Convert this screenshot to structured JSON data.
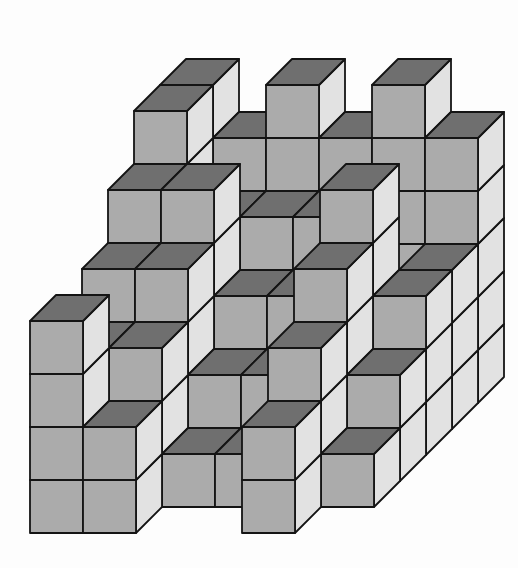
{
  "figure": {
    "type": "isometric_cube_stack",
    "grid": {
      "rows_deep": 6,
      "cols_wide": 6,
      "heights_front_to_back": [
        [
          4,
          2,
          0,
          0,
          2,
          0
        ],
        [
          3,
          3,
          1,
          1,
          3,
          1
        ],
        [
          4,
          4,
          2,
          2,
          4,
          2
        ],
        [
          5,
          5,
          3,
          3,
          5,
          3
        ],
        [
          6,
          4,
          4,
          4,
          2,
          3
        ],
        [
          6,
          5,
          6,
          5,
          6,
          5
        ]
      ]
    },
    "colors": {
      "front_face": "#ababab",
      "top_face": "#6f6f6f",
      "side_face": "#e2e2e2",
      "outline": "#141414",
      "background": "#fdfdfd"
    },
    "projection": {
      "cube_size": 53,
      "depth_offset_x": 26,
      "depth_offset_y": 26,
      "origin_x": 30,
      "origin_y": 533,
      "stroke_width": 1.8
    }
  }
}
